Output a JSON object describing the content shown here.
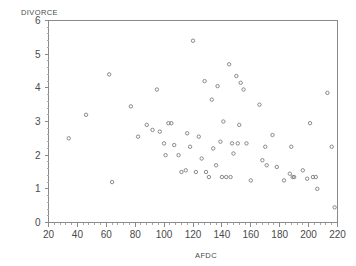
{
  "chart_data": {
    "type": "scatter",
    "title": "",
    "xlabel": "AFDC",
    "ylabel": "DIVORCE",
    "xlim": [
      20,
      220
    ],
    "ylim": [
      0,
      6
    ],
    "xticks": [
      20,
      40,
      60,
      80,
      100,
      120,
      140,
      160,
      180,
      200,
      220
    ],
    "yticks": [
      0,
      1,
      2,
      3,
      4,
      5,
      6
    ],
    "grid": false,
    "legend": null,
    "marker": "open-circle",
    "marker_color": "#7d7d7d",
    "points": [
      {
        "x": 34,
        "y": 2.5
      },
      {
        "x": 46,
        "y": 3.2
      },
      {
        "x": 62,
        "y": 4.4
      },
      {
        "x": 64,
        "y": 1.2
      },
      {
        "x": 77,
        "y": 3.45
      },
      {
        "x": 82,
        "y": 2.55
      },
      {
        "x": 88,
        "y": 2.9
      },
      {
        "x": 92,
        "y": 2.75
      },
      {
        "x": 95,
        "y": 3.95
      },
      {
        "x": 97,
        "y": 2.7
      },
      {
        "x": 100,
        "y": 2.35
      },
      {
        "x": 101,
        "y": 2.0
      },
      {
        "x": 103,
        "y": 2.95
      },
      {
        "x": 105,
        "y": 2.95
      },
      {
        "x": 107,
        "y": 2.3
      },
      {
        "x": 110,
        "y": 2.0
      },
      {
        "x": 112,
        "y": 1.5
      },
      {
        "x": 115,
        "y": 1.55
      },
      {
        "x": 116,
        "y": 2.65
      },
      {
        "x": 118,
        "y": 2.25
      },
      {
        "x": 120,
        "y": 5.4
      },
      {
        "x": 122,
        "y": 1.5
      },
      {
        "x": 124,
        "y": 2.55
      },
      {
        "x": 126,
        "y": 1.9
      },
      {
        "x": 128,
        "y": 4.2
      },
      {
        "x": 129,
        "y": 1.5
      },
      {
        "x": 131,
        "y": 1.35
      },
      {
        "x": 133,
        "y": 3.65
      },
      {
        "x": 134,
        "y": 2.2
      },
      {
        "x": 136,
        "y": 1.7
      },
      {
        "x": 137,
        "y": 4.05
      },
      {
        "x": 139,
        "y": 2.4
      },
      {
        "x": 140,
        "y": 1.35
      },
      {
        "x": 141,
        "y": 3.0
      },
      {
        "x": 143,
        "y": 1.35
      },
      {
        "x": 145,
        "y": 4.7
      },
      {
        "x": 146,
        "y": 1.35
      },
      {
        "x": 147,
        "y": 2.35
      },
      {
        "x": 148,
        "y": 2.05
      },
      {
        "x": 150,
        "y": 4.35
      },
      {
        "x": 151,
        "y": 2.35
      },
      {
        "x": 152,
        "y": 2.9
      },
      {
        "x": 153,
        "y": 4.15
      },
      {
        "x": 155,
        "y": 3.95
      },
      {
        "x": 157,
        "y": 2.35
      },
      {
        "x": 160,
        "y": 1.25
      },
      {
        "x": 166,
        "y": 3.5
      },
      {
        "x": 168,
        "y": 1.85
      },
      {
        "x": 170,
        "y": 2.25
      },
      {
        "x": 171,
        "y": 1.7
      },
      {
        "x": 175,
        "y": 2.6
      },
      {
        "x": 178,
        "y": 1.65
      },
      {
        "x": 183,
        "y": 1.25
      },
      {
        "x": 187,
        "y": 1.45
      },
      {
        "x": 188,
        "y": 2.25
      },
      {
        "x": 189,
        "y": 1.35
      },
      {
        "x": 190,
        "y": 1.35
      },
      {
        "x": 196,
        "y": 1.55
      },
      {
        "x": 199,
        "y": 1.3
      },
      {
        "x": 201,
        "y": 2.95
      },
      {
        "x": 203,
        "y": 1.35
      },
      {
        "x": 205,
        "y": 1.35
      },
      {
        "x": 206,
        "y": 1.0
      },
      {
        "x": 213,
        "y": 3.85
      },
      {
        "x": 216,
        "y": 2.25
      },
      {
        "x": 218,
        "y": 0.45
      }
    ]
  }
}
